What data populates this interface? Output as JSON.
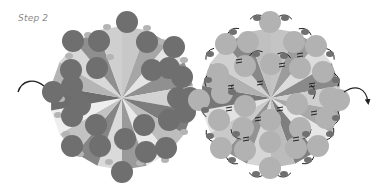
{
  "header": {
    "step_label": "Step 2"
  },
  "colors": {
    "background": "#ffffff",
    "label": "#8a8a8a",
    "thread": "#222222",
    "left_bead": "#6f6f6f",
    "left_small_bead": "#b4b4b4",
    "right_bead": "#b2b2b2",
    "right_small_bead": "#707070"
  },
  "left_component": {
    "center": [
      122,
      98
    ],
    "wedges": [
      "#c8c8c8",
      "#a6a6a6",
      "#e4e4e4",
      "#909090",
      "#d2d2d2",
      "#7c7c7c",
      "#bdbdbd",
      "#e9e9e9",
      "#9a9a9a",
      "#dadada",
      "#858585",
      "#c2c2c2",
      "#eeeeee",
      "#6d6d6d",
      "#b5b5b5",
      "#d8d8d8",
      "#8f8f8f",
      "#cfcfcf"
    ],
    "wedge_radius": 72,
    "beads": [
      [
        127,
        22
      ],
      [
        73,
        41
      ],
      [
        99,
        41
      ],
      [
        147,
        42
      ],
      [
        174,
        47
      ],
      [
        71,
        70
      ],
      [
        97,
        68
      ],
      [
        152,
        70
      ],
      [
        169,
        68
      ],
      [
        182,
        77
      ],
      [
        53,
        92
      ],
      [
        72,
        86
      ],
      [
        80,
        105
      ],
      [
        178,
        98
      ],
      [
        190,
        98
      ],
      [
        72,
        116
      ],
      [
        96,
        125
      ],
      [
        144,
        125
      ],
      [
        169,
        120
      ],
      [
        185,
        112
      ],
      [
        72,
        146
      ],
      [
        100,
        146
      ],
      [
        125,
        139
      ],
      [
        146,
        152
      ],
      [
        166,
        148
      ],
      [
        122,
        172
      ]
    ],
    "bead_radius": 11,
    "small_beads": [
      [
        107,
        27
      ],
      [
        147,
        28
      ],
      [
        88,
        35
      ],
      [
        162,
        42
      ],
      [
        69,
        56
      ],
      [
        184,
        60
      ],
      [
        60,
        78
      ],
      [
        188,
        82
      ],
      [
        61,
        99
      ],
      [
        193,
        96
      ],
      [
        58,
        115
      ],
      [
        190,
        114
      ],
      [
        66,
        134
      ],
      [
        184,
        132
      ],
      [
        80,
        154
      ],
      [
        165,
        160
      ],
      [
        109,
        162
      ],
      [
        140,
        163
      ],
      [
        110,
        57
      ],
      [
        138,
        128
      ]
    ],
    "arrow": {
      "path": "M 18 92 C 22 80, 34 78, 44 86"
    }
  },
  "right_component": {
    "center": [
      271,
      98
    ],
    "wedges": [
      "#c4c4c4",
      "#9c9c9c",
      "#dcdcdc",
      "#8a8a8a",
      "#cfcfcf",
      "#a9a9a9",
      "#e6e6e6",
      "#7f7f7f",
      "#bcbcbc",
      "#d6d6d6",
      "#939393",
      "#c9c9c9",
      "#e2e2e2",
      "#777777",
      "#b1b1b1",
      "#d0d0d0",
      "#888888",
      "#c0c0c0"
    ],
    "wedge_radius": 70,
    "beads": [
      [
        270,
        22
      ],
      [
        226,
        44
      ],
      [
        248,
        42
      ],
      [
        294,
        42
      ],
      [
        316,
        46
      ],
      [
        218,
        74
      ],
      [
        245,
        66
      ],
      [
        271,
        64
      ],
      [
        300,
        68
      ],
      [
        323,
        72
      ],
      [
        199,
        100
      ],
      [
        222,
        93
      ],
      [
        245,
        106
      ],
      [
        297,
        104
      ],
      [
        330,
        98
      ],
      [
        339,
        100
      ],
      [
        219,
        120
      ],
      [
        243,
        128
      ],
      [
        270,
        120
      ],
      [
        300,
        128
      ],
      [
        326,
        118
      ],
      [
        221,
        148
      ],
      [
        245,
        150
      ],
      [
        270,
        142
      ],
      [
        296,
        148
      ],
      [
        318,
        146
      ],
      [
        270,
        168
      ]
    ],
    "bead_radius": 11,
    "small_beads": [
      [
        257,
        18
      ],
      [
        285,
        18
      ],
      [
        233,
        32
      ],
      [
        305,
        32
      ],
      [
        210,
        54
      ],
      [
        330,
        54
      ],
      [
        208,
        80
      ],
      [
        336,
        80
      ],
      [
        205,
        110
      ],
      [
        336,
        118
      ],
      [
        210,
        136
      ],
      [
        330,
        134
      ],
      [
        232,
        160
      ],
      [
        308,
        160
      ],
      [
        256,
        174
      ],
      [
        284,
        174
      ],
      [
        256,
        54
      ],
      [
        284,
        56
      ],
      [
        232,
        92
      ],
      [
        312,
        92
      ],
      [
        236,
        134
      ],
      [
        306,
        134
      ]
    ],
    "thread_marks": [
      [
        239,
        62
      ],
      [
        282,
        66
      ],
      [
        300,
        56
      ],
      [
        231,
        88
      ],
      [
        312,
        86
      ],
      [
        229,
        110
      ],
      [
        314,
        114
      ],
      [
        246,
        140
      ],
      [
        296,
        140
      ],
      [
        260,
        84
      ],
      [
        280,
        110
      ],
      [
        258,
        120
      ]
    ],
    "arrow": {
      "path": "M 344 92 C 356 84, 366 88, 368 102"
    }
  }
}
